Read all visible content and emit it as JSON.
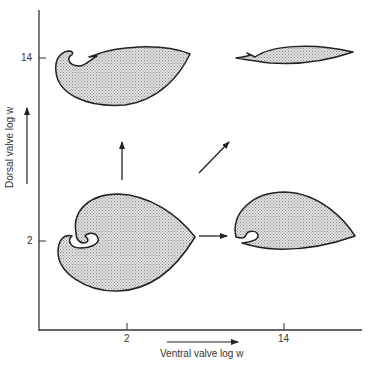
{
  "figure": {
    "type": "morphospace diagram",
    "x_axis": {
      "label": "Ventral valve log w",
      "ticks": [
        {
          "label": "2",
          "x": 127
        },
        {
          "label": "14",
          "x": 284
        }
      ]
    },
    "y_axis": {
      "label": "Dorsal valve log w",
      "ticks": [
        {
          "label": "14",
          "y": 58
        },
        {
          "label": "2",
          "y": 241
        }
      ]
    },
    "shapes": [
      {
        "name": "shell-ventral2-dorsal14",
        "position": "top-left",
        "description": "coiled beak, elongated shell"
      },
      {
        "name": "shell-ventral14-dorsal14",
        "position": "top-right",
        "description": "thin lenticular shell"
      },
      {
        "name": "shell-ventral2-dorsal2",
        "position": "bottom-left",
        "description": "heart-shaped shell with coiled umbo"
      },
      {
        "name": "shell-ventral14-dorsal2",
        "position": "bottom-right",
        "description": "teardrop shell with small curl"
      }
    ],
    "arrows": [
      {
        "name": "arrow-up",
        "direction": "up"
      },
      {
        "name": "arrow-diagonal",
        "direction": "up-right"
      },
      {
        "name": "arrow-right",
        "direction": "right"
      }
    ],
    "colors": {
      "fill": "#d0d0d0",
      "stroke": "#222222",
      "axis": "#333333"
    }
  }
}
